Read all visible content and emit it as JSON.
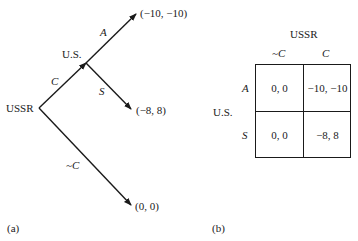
{
  "panel_a": {
    "caption": "(a)",
    "nodes": {
      "root": "USSR",
      "second": "U.S."
    },
    "edges": {
      "c": "C",
      "not_c": "~C",
      "a": "A",
      "s": "S"
    },
    "payoffs": {
      "a": "(−10, −10)",
      "s": "(−8, 8)",
      "not_c": "(0, 0)"
    }
  },
  "panel_b": {
    "caption": "(b)",
    "column_player": "USSR",
    "row_player": "U.S.",
    "columns": [
      "~C",
      "C"
    ],
    "rows": [
      {
        "label": "A",
        "cells": [
          "0, 0",
          "−10, −10"
        ]
      },
      {
        "label": "S",
        "cells": [
          "0, 0",
          "−8, 8"
        ]
      }
    ]
  }
}
